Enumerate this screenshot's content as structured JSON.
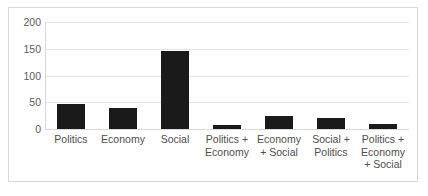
{
  "chart_data": {
    "type": "bar",
    "title": "",
    "subtitle": "",
    "xlabel": "",
    "ylabel": "",
    "categories": [
      "Politics",
      "Economy",
      "Social",
      "Politics + Economy",
      "Economy + Social",
      "Social + Politics",
      "Politics + Economy + Social"
    ],
    "values": [
      47,
      40,
      146,
      8,
      24,
      20,
      10
    ],
    "ylim": [
      0,
      200
    ],
    "yticks": [
      0,
      50,
      100,
      150,
      200
    ],
    "ytick_labels": [
      "0",
      "50",
      "100",
      "150",
      "200"
    ],
    "grid": true,
    "legend": false,
    "legend_position": "none",
    "bar_color": "#1a1a1a",
    "gridline_color": "#e6e6e6",
    "axis_color": "#d9d9d9",
    "plot_border_color": "#d9d9d9",
    "background_color": "#ffffff",
    "tick_label_color": "#5a5a5a"
  }
}
